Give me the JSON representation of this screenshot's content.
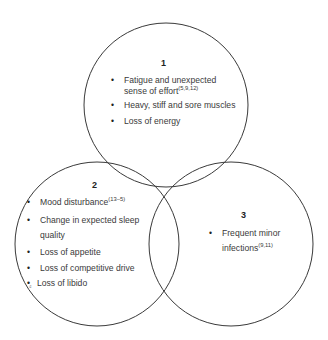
{
  "diagram": {
    "type": "venn",
    "circles": [
      {
        "id": 1,
        "cx": 166,
        "cy": 105,
        "r": 82
      },
      {
        "id": 2,
        "cx": 97,
        "cy": 244,
        "r": 82
      },
      {
        "id": 3,
        "cx": 231,
        "cy": 244,
        "r": 82
      }
    ],
    "stroke_color": "#3a3a3a"
  },
  "groups": [
    {
      "number": "1",
      "items": [
        {
          "text": "Fatigue and unexpected",
          "text2": "sense of effort",
          "ref": "(5,9,12)"
        },
        {
          "text": "Heavy, stiff and sore muscles"
        },
        {
          "text": "Loss of energy"
        }
      ]
    },
    {
      "number": "2",
      "items": [
        {
          "text": "Mood disturbance",
          "ref": "(13–5)"
        },
        {
          "text": "Change in expected sleep",
          "text2": "quality"
        },
        {
          "text": "Loss of appetite"
        },
        {
          "text": "Loss of competitive drive"
        },
        {
          "text": "Loss of libido",
          "artifact": "₫"
        }
      ]
    },
    {
      "number": "3",
      "items": [
        {
          "text": "Frequent minor",
          "text2": "infections",
          "ref": "(9,11)"
        }
      ]
    }
  ]
}
